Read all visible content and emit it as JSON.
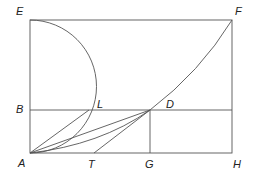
{
  "diagram": {
    "stroke_color": "#555555",
    "labels": {
      "E": "E",
      "F": "F",
      "B": "B",
      "L": "L",
      "D": "D",
      "A": "A",
      "T": "T",
      "G": "G",
      "H": "H"
    },
    "points": {
      "E": [
        30,
        20
      ],
      "F": [
        232,
        20
      ],
      "B": [
        30,
        110
      ],
      "L": [
        89,
        110
      ],
      "D": [
        150,
        110
      ],
      "A": [
        30,
        153
      ],
      "T": [
        94,
        153
      ],
      "G": [
        150,
        153
      ],
      "H": [
        232,
        153
      ]
    }
  }
}
